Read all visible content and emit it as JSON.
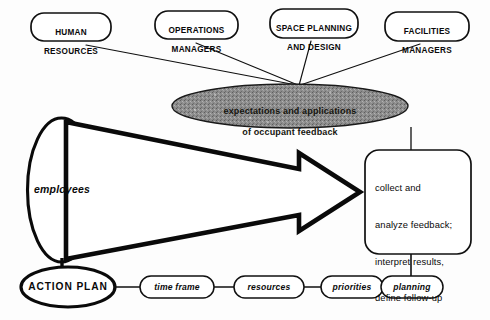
{
  "diagram": {
    "title": "expectations and applications of occupant feedback",
    "colors": {
      "stroke": "#101010",
      "hub_fill": "#8d8d8d",
      "background": "#fdfdfd"
    },
    "stakeholders": [
      {
        "id": "human-resources",
        "line1": "HUMAN",
        "line2": "RESOURCES"
      },
      {
        "id": "operations-managers",
        "line1": "OPERATIONS",
        "line2": "MANAGERS"
      },
      {
        "id": "space-planning",
        "line1": "SPACE PLANNING",
        "line2": "AND DESIGN"
      },
      {
        "id": "facilities-managers",
        "line1": "FACILITIES",
        "line2": "MANAGERS"
      }
    ],
    "hub": {
      "line1": "expectations and applications",
      "line2": "of occupant feedback"
    },
    "source": {
      "label": "employees"
    },
    "task": {
      "line1": "collect and",
      "line2": "analyze feedback;",
      "line3": "interpret results,",
      "line4": "define follow-up"
    },
    "action_plan": {
      "label": "ACTION PLAN"
    },
    "steps": [
      {
        "id": "time-frame",
        "label": "time frame"
      },
      {
        "id": "resources",
        "label": "resources"
      },
      {
        "id": "priorities",
        "label": "priorities"
      },
      {
        "id": "planning",
        "label": "planning"
      }
    ]
  }
}
